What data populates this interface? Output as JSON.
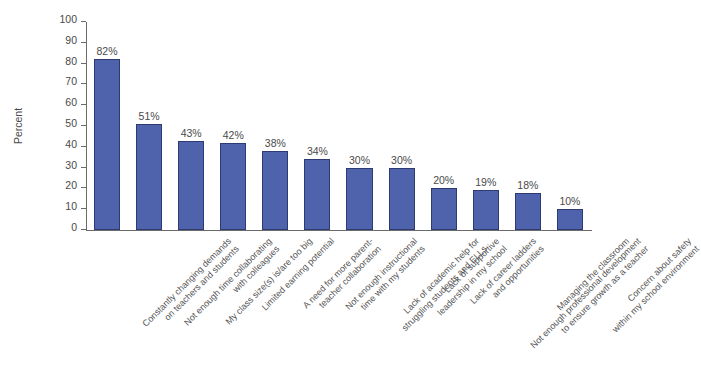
{
  "chart_data": {
    "type": "bar",
    "title": "",
    "xlabel": "",
    "ylabel": "Percent",
    "ylim": [
      0,
      100
    ],
    "ytick_step": 10,
    "grid": false,
    "legend": null,
    "bar_color": "#4f63ad",
    "bar_border_color": "#2e3b73",
    "value_suffix": "%",
    "yticks": [
      "100",
      "90",
      "80",
      "70",
      "60",
      "50",
      "40",
      "30",
      "20",
      "10",
      "0"
    ],
    "categories": [
      "Constantly changing demands on teachers and students",
      "Not enough time collaborating with colleagues",
      "My class size(s) is/are too big",
      "Limited earning potential",
      "A need for more parent-teacher collaboration",
      "Not enough instructional time with my students",
      "Lack of academic help for struggling students and ELLs",
      "Lack of supportive leadership in my school",
      "Lack of career ladders and opportunities",
      "Not enough professional development to ensure growth as a teacher",
      "Managing the classroom",
      "Concern about safety within my school environment"
    ],
    "category_lines": [
      [
        "Constantly changing demands",
        "on teachers and students"
      ],
      [
        "Not enough time collaborating",
        "with colleagues"
      ],
      [
        "My class size(s) is/are too big",
        ""
      ],
      [
        "Limited earning potential",
        ""
      ],
      [
        "A need for more parent-",
        "teacher collaboration"
      ],
      [
        "Not enough instructional",
        "time with my students"
      ],
      [
        "Lack of academic help for",
        "struggling students and ELLs"
      ],
      [
        "Lack of supportive",
        "leadership in my school"
      ],
      [
        "Lack of career ladders",
        "and opportunities"
      ],
      [
        "Not enough professional development",
        "to ensure growth as a teacher"
      ],
      [
        "Managing the classroom",
        ""
      ],
      [
        "Concern about safety",
        "within my school environment"
      ]
    ],
    "values": [
      82,
      51,
      43,
      42,
      38,
      34,
      30,
      30,
      20,
      19,
      18,
      10
    ],
    "value_labels": [
      "82%",
      "51%",
      "43%",
      "42%",
      "38%",
      "34%",
      "30%",
      "30%",
      "20%",
      "19%",
      "18%",
      "10%"
    ]
  }
}
